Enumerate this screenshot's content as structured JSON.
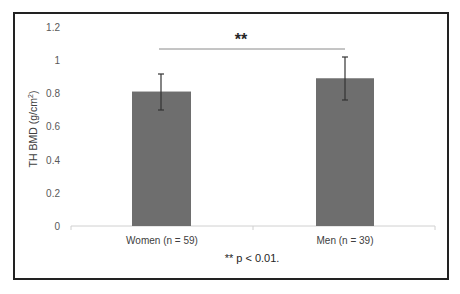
{
  "chart_data": {
    "type": "bar",
    "title": "",
    "xlabel": "",
    "ylabel": "TH BMD (g/cm²)",
    "ylabel_base": "TH BMD (g/cm",
    "ylabel_sup": "2",
    "ylabel_close": ")",
    "categories": [
      "Women (n = 59)",
      "Men (n = 39)"
    ],
    "values": [
      0.81,
      0.89
    ],
    "error_bars": [
      0.11,
      0.13
    ],
    "ylim": [
      0,
      1.2
    ],
    "yticks": [
      "0",
      "0.2",
      "0.4",
      "0.6",
      "0.8",
      "1",
      "1.2"
    ],
    "bar_color": "#6e6e6e",
    "grid": false,
    "legend": null,
    "annotations": {
      "significance_marker": "**",
      "significance_bracket": [
        "Women (n = 59)",
        "Men (n = 39)"
      ],
      "footnote": "** p < 0.01."
    }
  }
}
